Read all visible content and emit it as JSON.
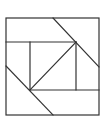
{
  "diagram": {
    "type": "geometric-line-figure",
    "stroke_color": "#333333",
    "background": "#ffffff",
    "outer_square": {
      "x1": 6,
      "y1": 18,
      "x2": 99,
      "y2": 115
    },
    "segments": [
      {
        "name": "top-diagonal",
        "x1": 53,
        "y1": 18,
        "x2": 99,
        "y2": 67
      },
      {
        "name": "upper-horizontal",
        "x1": 6,
        "y1": 42,
        "x2": 76,
        "y2": 42
      },
      {
        "name": "inner-left-vertical",
        "x1": 30,
        "y1": 42,
        "x2": 30,
        "y2": 90
      },
      {
        "name": "inner-right-vertical",
        "x1": 76,
        "y1": 42,
        "x2": 76,
        "y2": 90
      },
      {
        "name": "lower-horizontal",
        "x1": 30,
        "y1": 90,
        "x2": 99,
        "y2": 90
      },
      {
        "name": "inner-diagonal",
        "x1": 76,
        "y1": 42,
        "x2": 30,
        "y2": 90
      },
      {
        "name": "bottom-diagonal",
        "x1": 6,
        "y1": 66,
        "x2": 53,
        "y2": 115
      }
    ]
  }
}
